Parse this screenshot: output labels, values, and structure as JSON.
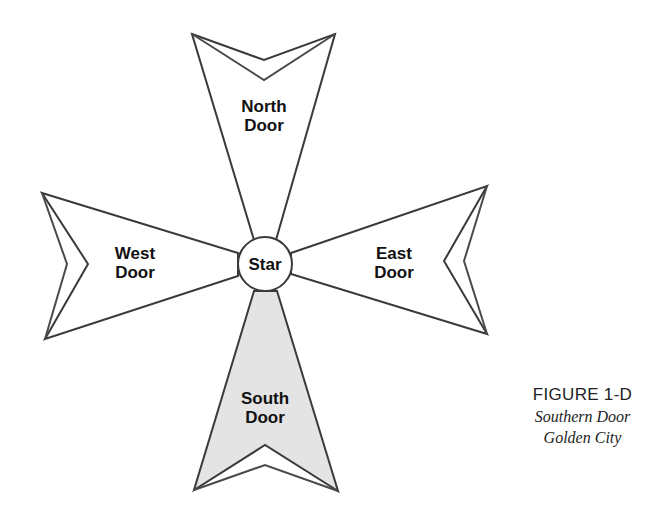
{
  "diagram": {
    "center": {
      "label": "Star"
    },
    "doors": [
      {
        "id": "north",
        "line1": "North",
        "line2": "Door",
        "fill": "#ffffff"
      },
      {
        "id": "east",
        "line1": "East",
        "line2": "Door",
        "fill": "#ffffff"
      },
      {
        "id": "south",
        "line1": "South",
        "line2": "Door",
        "fill": "#e4e4e4",
        "highlighted": true
      },
      {
        "id": "west",
        "line1": "West",
        "line2": "Door",
        "fill": "#ffffff"
      }
    ],
    "colors": {
      "stroke": "#3a3a3a",
      "highlight_fill": "#e4e4e4",
      "background": "#ffffff"
    }
  },
  "caption": {
    "title": "FIGURE 1-D",
    "line1": "Southern Door",
    "line2": "Golden City"
  }
}
